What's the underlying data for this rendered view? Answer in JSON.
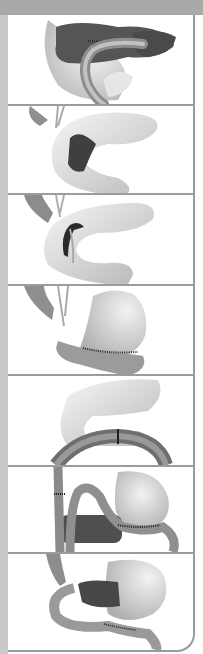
{
  "figure": {
    "colors": {
      "banner": "#a9a9a9",
      "left_strip": "#c9c9c9",
      "border": "#9a9a9a",
      "organ_light": "#e8e8e8",
      "organ_mid": "#bdbdbd",
      "organ_dark": "#4a4a4a",
      "staple_line": "#222222"
    },
    "panels": [
      {
        "id": 1,
        "subject": "pancreas with duodenum/jejunal loop anastomosis",
        "top": 15,
        "height": 89
      },
      {
        "id": 2,
        "subject": "stomach with dark resected region (gastric wall)",
        "top": 106,
        "height": 87
      },
      {
        "id": 3,
        "subject": "stomach with dark narrow sleeve/strip along lesser curvature",
        "top": 195,
        "height": 89
      },
      {
        "id": 4,
        "subject": "stomach with stapled anastomosis to small bowel along greater curvature",
        "top": 286,
        "height": 88
      },
      {
        "id": 5,
        "subject": "stomach above segmented colon loop",
        "top": 376,
        "height": 89
      },
      {
        "id": 6,
        "subject": "stomach with Roux-en-Y limbs and dark pancreas segment",
        "top": 467,
        "height": 85
      },
      {
        "id": 7,
        "subject": "stomach with dark duodenal segment and stapled jejunal loop",
        "top": 554,
        "height": 96
      }
    ]
  }
}
